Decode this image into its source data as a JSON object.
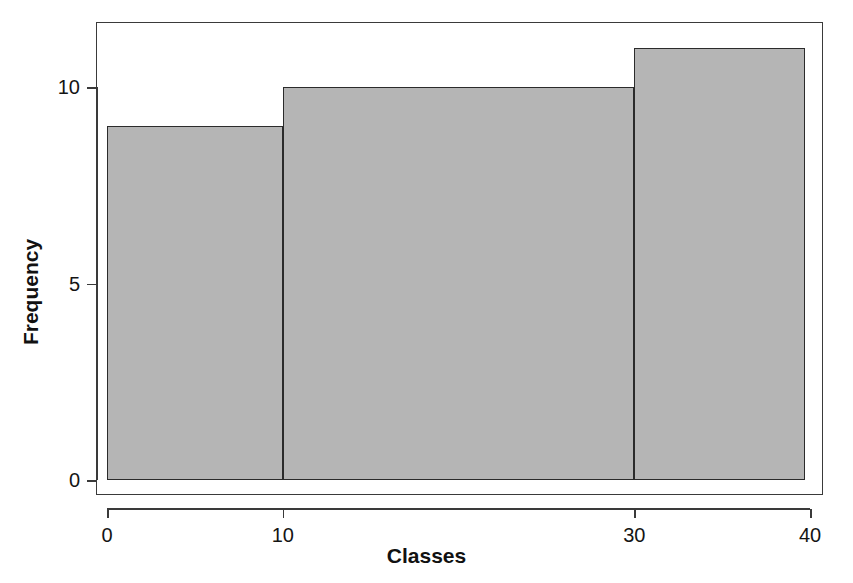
{
  "chart_data": {
    "type": "bar",
    "title": "",
    "subtitle": "",
    "xlabel": "Classes",
    "ylabel": "Frequency",
    "xlim": [
      0,
      40
    ],
    "ylim": [
      0,
      11
    ],
    "grid": false,
    "legend": null,
    "bin_edges": [
      0,
      10,
      30,
      40
    ],
    "categories": [
      "0-10",
      "10-30",
      "30-40"
    ],
    "values": [
      9,
      10,
      11
    ],
    "bars": [
      {
        "label": "0-10",
        "x_start": 0,
        "x_end": 10,
        "value": 9
      },
      {
        "label": "10-30",
        "x_start": 10,
        "x_end": 30,
        "value": 10
      },
      {
        "label": "30-40",
        "x_start": 30,
        "x_end": 40,
        "value": 11
      }
    ],
    "x_ticks": [
      {
        "value": 0,
        "label": "0"
      },
      {
        "value": 10,
        "label": "10"
      },
      {
        "value": 30,
        "label": "30"
      },
      {
        "value": 40,
        "label": "40"
      }
    ],
    "y_ticks": [
      {
        "value": 0,
        "label": "0"
      },
      {
        "value": 5,
        "label": "5"
      },
      {
        "value": 10,
        "label": "10"
      }
    ],
    "colors": {
      "bar_fill": "#b5b5b5",
      "bar_border": "#2b2b2b",
      "axis": "#3a3a3a",
      "text": "#141414",
      "background": "#ffffff"
    }
  }
}
